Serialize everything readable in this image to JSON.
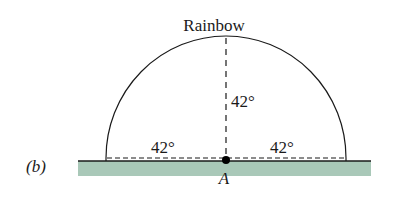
{
  "figure": {
    "panel_label": "(b)",
    "title": "Rainbow",
    "angle_vertical": "42°",
    "angle_left": "42°",
    "angle_right": "42°",
    "observer_label": "A"
  },
  "colors": {
    "ground": "#a9c8b8",
    "line": "#1a1a1a",
    "background": "#ffffff"
  },
  "geometry": {
    "observer": {
      "x": 226,
      "y": 160
    },
    "arc_radius_x": 120,
    "arc_radius_y": 124,
    "ground": {
      "x1": 78,
      "x2": 371,
      "top": 161,
      "bottom": 176
    }
  }
}
